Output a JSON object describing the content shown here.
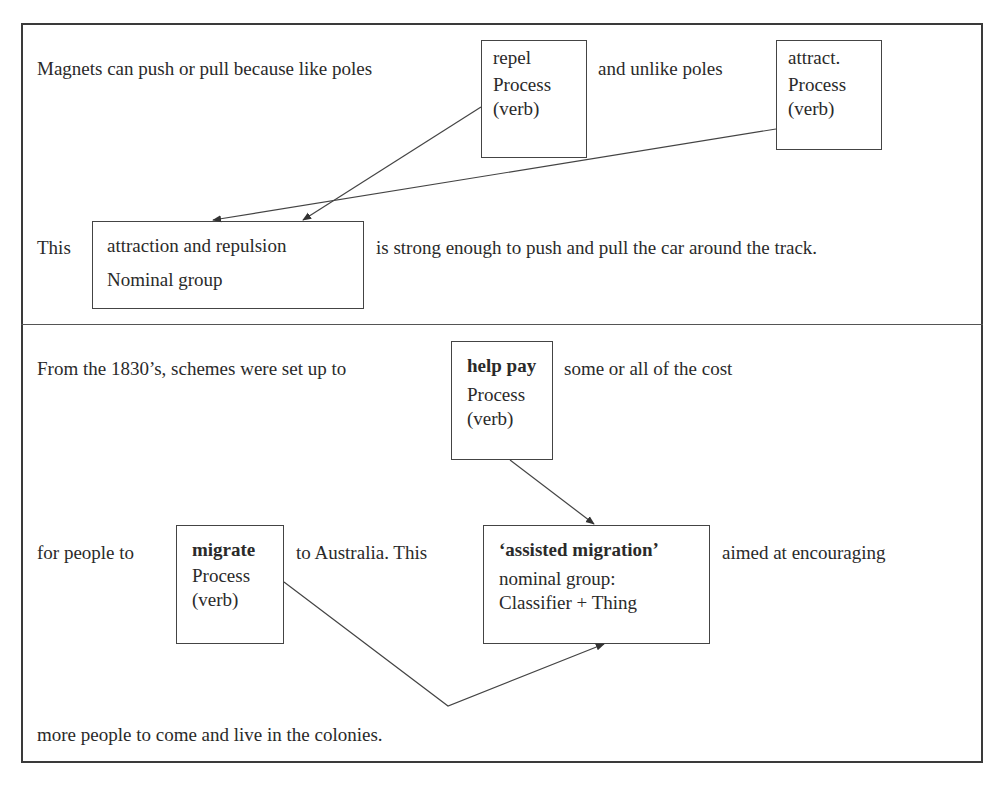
{
  "example1": {
    "line1": {
      "before": "Magnets can push or pull because like poles",
      "middle": "and unlike poles"
    },
    "box_repel": {
      "word": "repel",
      "label_line1": "Process",
      "label_line2": "(verb)"
    },
    "box_attract": {
      "word": "attract.",
      "label_line1": "Process",
      "label_line2": "(verb)"
    },
    "line2": {
      "before": "This",
      "after": "is strong enough to push and pull the car around the track."
    },
    "box_nominal": {
      "word": "attraction and repulsion",
      "label": "Nominal group"
    }
  },
  "example2": {
    "line1": {
      "before": "From the 1830’s, schemes were set up to",
      "after": "some or all of the cost"
    },
    "box_help_pay": {
      "word": "help pay",
      "label_line1": "Process",
      "label_line2": "(verb)"
    },
    "line2": {
      "before": "for people to",
      "middle": "to Australia. This",
      "after": "aimed at encouraging"
    },
    "box_migrate": {
      "word": "migrate",
      "label_line1": "Process",
      "label_line2": "(verb)"
    },
    "box_assisted": {
      "word": "‘assisted migration’",
      "label_line1": "nominal group:",
      "label_line2": "Classifier + Thing"
    },
    "line3": "more people to come and live in the colonies."
  },
  "colors": {
    "text": "#2a2a2a",
    "lines": "#444444",
    "background": "#ffffff"
  }
}
